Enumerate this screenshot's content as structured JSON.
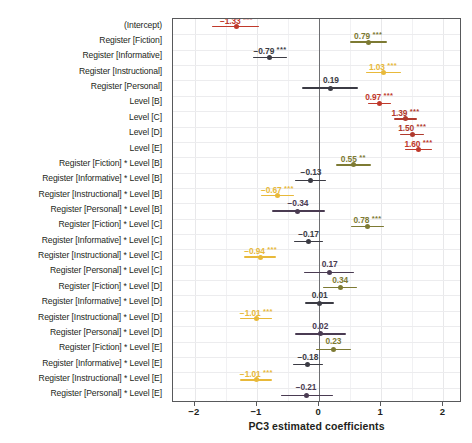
{
  "chart_data": {
    "type": "scatter",
    "title": "",
    "xlabel": "PC3 estimated coefficients",
    "ylabel": "",
    "xlim": [
      -2.35,
      2.3
    ],
    "xticks": [
      -2,
      -1,
      0,
      1,
      2
    ],
    "xticklabels": [
      "−2",
      "−1",
      "0",
      "1",
      "2"
    ],
    "grid": true,
    "zero_reference_line": 0,
    "orientation": "horizontal",
    "legend": "none",
    "colors": {
      "dark_red": "#c0392b",
      "brick_red": "#b03a2e",
      "olive": "#7d7a33",
      "gold": "#e8b93a",
      "charcoal": "#3b3b44",
      "purple_grey": "#4a3b52",
      "axis": "#58595b",
      "grid": "#e8e8ea",
      "zero_line": "#6d6e71"
    },
    "categories": [
      "(Intercept)",
      "Register [Fiction]",
      "Register [Informative]",
      "Register [Instructional]",
      "Register [Personal]",
      "Level [B]",
      "Level [C]",
      "Level [D]",
      "Level [E]",
      "Register [Fiction] * Level [B]",
      "Register [Informative] * Level [B]",
      "Register [Instructional] * Level [B]",
      "Register [Personal] * Level [B]",
      "Register [Fiction] * Level [C]",
      "Register [Informative] * Level [C]",
      "Register [Instructional] * Level [C]",
      "Register [Personal] * Level [C]",
      "Register [Fiction] * Level [D]",
      "Register [Informative] * Level [D]",
      "Register [Instructional] * Level [D]",
      "Register [Personal] * Level [D]",
      "Register [Fiction] * Level [E]",
      "Register [Informative] * Level [E]",
      "Register [Instructional] * Level [E]",
      "Register [Personal] * Level [E]"
    ],
    "points": [
      {
        "label": "(Intercept)",
        "value": -1.33,
        "text": "−1.33",
        "stars": "***",
        "ci_low": -1.72,
        "ci_high": -0.96,
        "color": "#c0392b"
      },
      {
        "label": "Register [Fiction]",
        "value": 0.79,
        "text": "0.79",
        "stars": "***",
        "ci_low": 0.5,
        "ci_high": 1.09,
        "color": "#7d7a33"
      },
      {
        "label": "Register [Informative]",
        "value": -0.79,
        "text": "−0.79",
        "stars": "***",
        "ci_low": -1.07,
        "ci_high": -0.51,
        "color": "#3b3b44"
      },
      {
        "label": "Register [Instructional]",
        "value": 1.03,
        "text": "1.03",
        "stars": "***",
        "ci_low": 0.76,
        "ci_high": 1.32,
        "color": "#e8b93a"
      },
      {
        "label": "Register [Personal]",
        "value": 0.19,
        "text": "0.19",
        "stars": "",
        "ci_low": -0.27,
        "ci_high": 0.63,
        "color": "#3b3b44"
      },
      {
        "label": "Level [B]",
        "value": 0.97,
        "text": "0.97",
        "stars": "***",
        "ci_low": 0.79,
        "ci_high": 1.16,
        "color": "#c0392b"
      },
      {
        "label": "Level [C]",
        "value": 1.39,
        "text": "1.39",
        "stars": "***",
        "ci_low": 1.2,
        "ci_high": 1.58,
        "color": "#b03a2e"
      },
      {
        "label": "Level [D]",
        "value": 1.5,
        "text": "1.50",
        "stars": "***",
        "ci_low": 1.31,
        "ci_high": 1.69,
        "color": "#b03a2e"
      },
      {
        "label": "Level [E]",
        "value": 1.6,
        "text": "1.60",
        "stars": "***",
        "ci_low": 1.39,
        "ci_high": 1.82,
        "color": "#c0392b"
      },
      {
        "label": "Register [Fiction] * Level [B]",
        "value": 0.55,
        "text": "0.55",
        "stars": "**",
        "ci_low": 0.27,
        "ci_high": 0.83,
        "color": "#7d7a33"
      },
      {
        "label": "Register [Informative] * Level [B]",
        "value": -0.13,
        "text": "−0.13",
        "stars": "",
        "ci_low": -0.38,
        "ci_high": 0.11,
        "color": "#3b3b44"
      },
      {
        "label": "Register [Instructional] * Level [B]",
        "value": -0.67,
        "text": "−0.67",
        "stars": "***",
        "ci_low": -0.93,
        "ci_high": -0.41,
        "color": "#e8b93a"
      },
      {
        "label": "Register [Personal] * Level [B]",
        "value": -0.34,
        "text": "−0.34",
        "stars": "",
        "ci_low": -0.76,
        "ci_high": 0.09,
        "color": "#4a3b52"
      },
      {
        "label": "Register [Fiction] * Level [C]",
        "value": 0.78,
        "text": "0.78",
        "stars": "***",
        "ci_low": 0.52,
        "ci_high": 1.05,
        "color": "#7d7a33"
      },
      {
        "label": "Register [Informative] * Level [C]",
        "value": -0.17,
        "text": "−0.17",
        "stars": "",
        "ci_low": -0.41,
        "ci_high": 0.07,
        "color": "#3b3b44"
      },
      {
        "label": "Register [Instructional] * Level [C]",
        "value": -0.94,
        "text": "−0.94",
        "stars": "***",
        "ci_low": -1.2,
        "ci_high": -0.69,
        "color": "#e8b93a"
      },
      {
        "label": "Register [Personal] * Level [C]",
        "value": 0.17,
        "text": "0.17",
        "stars": "",
        "ci_low": -0.24,
        "ci_high": 0.57,
        "color": "#4a3b52"
      },
      {
        "label": "Register [Fiction] * Level [D]",
        "value": 0.34,
        "text": "0.34",
        "stars": "",
        "ci_low": 0.07,
        "ci_high": 0.61,
        "color": "#7d7a33"
      },
      {
        "label": "Register [Informative] * Level [D]",
        "value": 0.01,
        "text": "0.01",
        "stars": "",
        "ci_low": -0.23,
        "ci_high": 0.24,
        "color": "#3b3b44"
      },
      {
        "label": "Register [Instructional] * Level [D]",
        "value": -1.01,
        "text": "−1.01",
        "stars": "***",
        "ci_low": -1.27,
        "ci_high": -0.75,
        "color": "#e8b93a"
      },
      {
        "label": "Register [Personal] * Level [D]",
        "value": 0.02,
        "text": "0.02",
        "stars": "",
        "ci_low": -0.39,
        "ci_high": 0.43,
        "color": "#4a3b52"
      },
      {
        "label": "Register [Fiction] * Level [E]",
        "value": 0.23,
        "text": "0.23",
        "stars": "",
        "ci_low": -0.05,
        "ci_high": 0.51,
        "color": "#7d7a33"
      },
      {
        "label": "Register [Informative] * Level [E]",
        "value": -0.18,
        "text": "−0.18",
        "stars": "",
        "ci_low": -0.42,
        "ci_high": 0.07,
        "color": "#3b3b44"
      },
      {
        "label": "Register [Instructional] * Level [E]",
        "value": -1.01,
        "text": "−1.01",
        "stars": "***",
        "ci_low": -1.27,
        "ci_high": -0.75,
        "color": "#e8b93a"
      },
      {
        "label": "Register [Personal] * Level [E]",
        "value": -0.21,
        "text": "−0.21",
        "stars": "",
        "ci_low": -0.62,
        "ci_high": 0.22,
        "color": "#4a3b52"
      }
    ]
  }
}
